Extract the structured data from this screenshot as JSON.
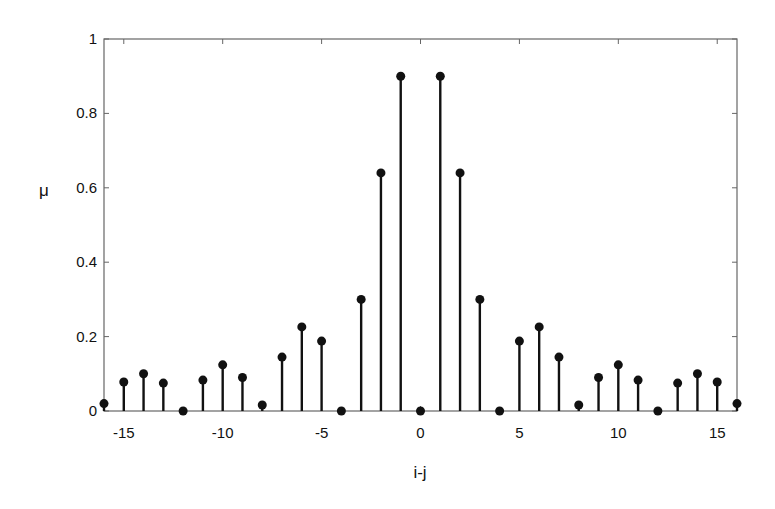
{
  "chart_data": {
    "type": "stem",
    "title": "",
    "xlabel": "i-j",
    "ylabel": "μ",
    "xlim": [
      -16,
      16
    ],
    "ylim": [
      0,
      1
    ],
    "xticks": [
      -15,
      -10,
      -5,
      0,
      5,
      10,
      15
    ],
    "xtick_labels": [
      "-15",
      "-10",
      "-5",
      "0",
      "5",
      "10",
      "15"
    ],
    "yticks": [
      0,
      0.2,
      0.4,
      0.6,
      0.8,
      1
    ],
    "ytick_labels": [
      "0",
      "0.2",
      "0.4",
      "0.6",
      "0.8",
      "1"
    ],
    "grid": false,
    "legend": null,
    "x": [
      -16,
      -15,
      -14,
      -13,
      -12,
      -11,
      -10,
      -9,
      -8,
      -7,
      -6,
      -5,
      -4,
      -3,
      -2,
      -1,
      0,
      1,
      2,
      3,
      4,
      5,
      6,
      7,
      8,
      9,
      10,
      11,
      12,
      13,
      14,
      15,
      16
    ],
    "values": [
      0.02,
      0.078,
      0.1,
      0.075,
      0.0,
      0.083,
      0.124,
      0.09,
      0.016,
      0.145,
      0.226,
      0.188,
      0.0,
      0.3,
      0.64,
      0.9,
      0.0,
      0.9,
      0.64,
      0.3,
      0.0,
      0.188,
      0.226,
      0.145,
      0.016,
      0.09,
      0.124,
      0.083,
      0.0,
      0.075,
      0.1,
      0.078,
      0.02
    ],
    "colors": {
      "stem": "#111111",
      "axis": "#555555"
    }
  }
}
